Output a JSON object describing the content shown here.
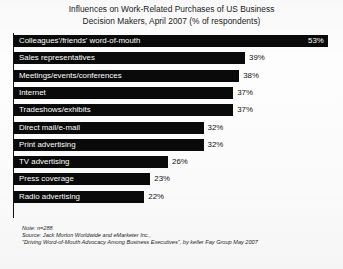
{
  "chart_data": {
    "type": "bar",
    "orientation": "horizontal",
    "title": "Influences on Work-Related Purchases of US Business Decision Makers, April 2007 (% of respondents)",
    "title_lines": [
      "Influences on Work-Related Purchases of US Business",
      "Decision Makers, April 2007 (% of respondents)"
    ],
    "xlabel": "",
    "ylabel": "",
    "xlim": [
      0,
      53
    ],
    "grid": false,
    "legend": "none",
    "value_suffix": "%",
    "categories": [
      "Colleagues'/friends' word-of-mouth",
      "Sales representatives",
      "Meetings/events/conferences",
      "Internet",
      "Tradeshows/exhibits",
      "Direct mail/e-mail",
      "Print advertising",
      "TV advertising",
      "Press coverage",
      "Radio advertising"
    ],
    "values": [
      53,
      39,
      38,
      37,
      37,
      32,
      32,
      26,
      23,
      22
    ],
    "value_labels": [
      "53%",
      "39%",
      "38%",
      "37%",
      "37%",
      "32%",
      "32%",
      "26%",
      "23%",
      "22%"
    ],
    "bars": [
      {
        "label": "Colleagues'/friends' word-of-mouth",
        "value": 53,
        "value_label": "53%",
        "label_inside": true,
        "value_inside": true
      },
      {
        "label": "Sales representatives",
        "value": 39,
        "value_label": "39%",
        "label_inside": true,
        "value_inside": false
      },
      {
        "label": "Meetings/events/conferences",
        "value": 38,
        "value_label": "38%",
        "label_inside": true,
        "value_inside": false
      },
      {
        "label": "Internet",
        "value": 37,
        "value_label": "37%",
        "label_inside": true,
        "value_inside": false
      },
      {
        "label": "Tradeshows/exhibits",
        "value": 37,
        "value_label": "37%",
        "label_inside": true,
        "value_inside": false
      },
      {
        "label": "Direct mail/e-mail",
        "value": 32,
        "value_label": "32%",
        "label_inside": true,
        "value_inside": false
      },
      {
        "label": "Print advertising",
        "value": 32,
        "value_label": "32%",
        "label_inside": true,
        "value_inside": false
      },
      {
        "label": "TV advertising",
        "value": 26,
        "value_label": "26%",
        "label_inside": true,
        "value_inside": false
      },
      {
        "label": "Press coverage",
        "value": 23,
        "value_label": "23%",
        "label_inside": true,
        "value_inside": false
      },
      {
        "label": "Radio advertising",
        "value": 22,
        "value_label": "22%",
        "label_inside": true,
        "value_inside": false
      }
    ],
    "bar_color": "#0a0a0a",
    "background_color": "#fdfdfd"
  },
  "footnote": {
    "line1": "Note: n=288",
    "line2": "Source: Jack Morton Worldwide and eMarketer Inc.,",
    "line3": "\"Driving Word-of-Mouth Advocacy Among Business Executives\", by keller Fay Group May 2007"
  }
}
